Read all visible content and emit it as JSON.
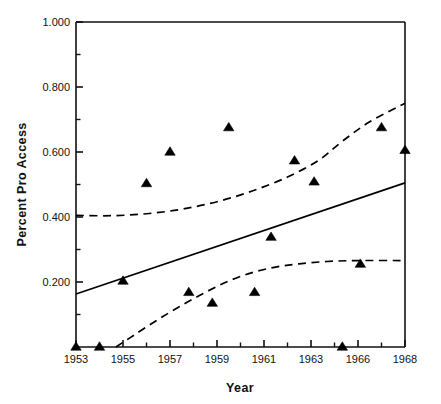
{
  "chart_data": {
    "type": "scatter",
    "title": "",
    "xlabel": "Year",
    "ylabel": "Percent Pro Access",
    "xlim": [
      1953,
      1968
    ],
    "ylim": [
      0.0,
      1.0
    ],
    "grid": false,
    "legend": null,
    "x_tick_labels": [
      "1953",
      "1955",
      "1957",
      "1959",
      "1961",
      "1963",
      "1966",
      "1968"
    ],
    "x_tick_values": [
      1953,
      1955,
      1957,
      1959,
      1961,
      1963,
      1966,
      1968
    ],
    "y_tick_labels": [
      "0.200",
      "0.400",
      "0.600",
      "0.800",
      "1.000"
    ],
    "y_tick_values": [
      0.2,
      0.4,
      0.6,
      0.8,
      1.0
    ],
    "y_minor_ticks": [
      0.1,
      0.3,
      0.5,
      0.7,
      0.9
    ],
    "series": [
      {
        "name": "observed-points",
        "type": "scatter",
        "marker": "triangle",
        "color": "#000000",
        "points": [
          {
            "x": 1953.0,
            "y": 0.0
          },
          {
            "x": 1954.0,
            "y": 0.0
          },
          {
            "x": 1955.0,
            "y": 0.203
          },
          {
            "x": 1956.0,
            "y": 0.503
          },
          {
            "x": 1957.0,
            "y": 0.6
          },
          {
            "x": 1957.8,
            "y": 0.168
          },
          {
            "x": 1958.8,
            "y": 0.135
          },
          {
            "x": 1959.5,
            "y": 0.675
          },
          {
            "x": 1960.6,
            "y": 0.168
          },
          {
            "x": 1961.3,
            "y": 0.338
          },
          {
            "x": 1962.3,
            "y": 0.573
          },
          {
            "x": 1963.2,
            "y": 0.508
          },
          {
            "x": 1965.0,
            "y": 0.0
          },
          {
            "x": 1966.1,
            "y": 0.255
          },
          {
            "x": 1967.0,
            "y": 0.675
          },
          {
            "x": 1968.0,
            "y": 0.605
          }
        ]
      },
      {
        "name": "fitted-line",
        "type": "line",
        "style": "solid",
        "color": "#000000",
        "points": [
          {
            "x": 1953.0,
            "y": 0.163
          },
          {
            "x": 1968.0,
            "y": 0.505
          }
        ]
      },
      {
        "name": "upper-confidence-band",
        "type": "line",
        "style": "dashed",
        "color": "#000000",
        "points": [
          {
            "x": 1953.0,
            "y": 0.405
          },
          {
            "x": 1954.5,
            "y": 0.404
          },
          {
            "x": 1956.0,
            "y": 0.41
          },
          {
            "x": 1957.5,
            "y": 0.424
          },
          {
            "x": 1959.0,
            "y": 0.447
          },
          {
            "x": 1960.5,
            "y": 0.48
          },
          {
            "x": 1962.0,
            "y": 0.523
          },
          {
            "x": 1963.5,
            "y": 0.575
          },
          {
            "x": 1965.0,
            "y": 0.633
          },
          {
            "x": 1966.5,
            "y": 0.693
          },
          {
            "x": 1968.0,
            "y": 0.75
          }
        ]
      },
      {
        "name": "lower-confidence-band",
        "type": "line",
        "style": "dashed",
        "color": "#000000",
        "points": [
          {
            "x": 1954.7,
            "y": 0.0
          },
          {
            "x": 1955.5,
            "y": 0.038
          },
          {
            "x": 1956.5,
            "y": 0.085
          },
          {
            "x": 1957.5,
            "y": 0.128
          },
          {
            "x": 1958.5,
            "y": 0.168
          },
          {
            "x": 1959.5,
            "y": 0.203
          },
          {
            "x": 1960.5,
            "y": 0.229
          },
          {
            "x": 1961.5,
            "y": 0.246
          },
          {
            "x": 1962.5,
            "y": 0.256
          },
          {
            "x": 1964.0,
            "y": 0.263
          },
          {
            "x": 1966.0,
            "y": 0.266
          },
          {
            "x": 1968.0,
            "y": 0.266
          }
        ]
      }
    ]
  }
}
